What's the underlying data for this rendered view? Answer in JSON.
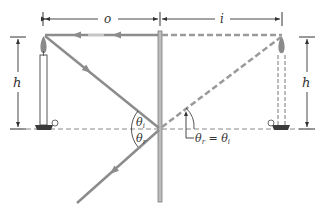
{
  "diagram": {
    "labels": {
      "object_distance": "o",
      "image_distance": "i",
      "height_left": "h",
      "height_right": "h",
      "theta_i": "θi",
      "theta_r": "θr",
      "angle_equality": "θr = θi"
    },
    "colors": {
      "ray": "#8c8c8c",
      "mirror": "#9a9a9a",
      "dimension": "#333333",
      "candle_base": "#3a3a3a"
    }
  }
}
